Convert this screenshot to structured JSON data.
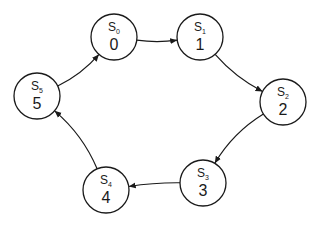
{
  "diagram": {
    "type": "state-transition-cycle",
    "nodes": [
      {
        "id": "S0",
        "name": "S",
        "sub": "0",
        "value": "0"
      },
      {
        "id": "S1",
        "name": "S",
        "sub": "1",
        "value": "1"
      },
      {
        "id": "S2",
        "name": "S",
        "sub": "2",
        "value": "2"
      },
      {
        "id": "S3",
        "name": "S",
        "sub": "3",
        "value": "3"
      },
      {
        "id": "S4",
        "name": "S",
        "sub": "4",
        "value": "4"
      },
      {
        "id": "S5",
        "name": "S",
        "sub": "5",
        "value": "5"
      }
    ],
    "edges": [
      {
        "from": "S0",
        "to": "S1"
      },
      {
        "from": "S1",
        "to": "S2"
      },
      {
        "from": "S2",
        "to": "S3"
      },
      {
        "from": "S3",
        "to": "S4"
      },
      {
        "from": "S4",
        "to": "S5"
      },
      {
        "from": "S5",
        "to": "S0"
      }
    ]
  }
}
